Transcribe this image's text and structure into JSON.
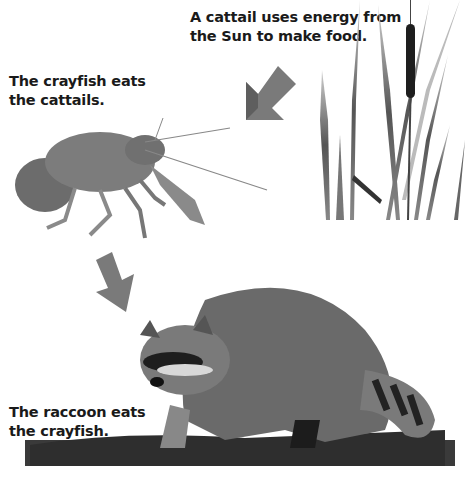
{
  "diagram": {
    "type": "food-chain",
    "colors": {
      "arrow": "#7a7a7a",
      "text": "#1a1a1a",
      "background": "#ffffff"
    },
    "nodes": [
      {
        "id": "cattail",
        "label": "Cattail",
        "caption_lines": [
          "A cattail uses energy from",
          "the Sun to make food."
        ]
      },
      {
        "id": "crayfish",
        "label": "Crayfish",
        "caption_lines": [
          "The crayfish eats",
          "the cattails."
        ]
      },
      {
        "id": "raccoon",
        "label": "Raccoon",
        "caption_lines": [
          "The raccoon eats",
          "the crayfish."
        ]
      }
    ],
    "edges": [
      {
        "from": "cattail",
        "to": "crayfish",
        "icon": "arrow-down-left-icon"
      },
      {
        "from": "crayfish",
        "to": "raccoon",
        "icon": "arrow-down-right-icon"
      }
    ]
  }
}
